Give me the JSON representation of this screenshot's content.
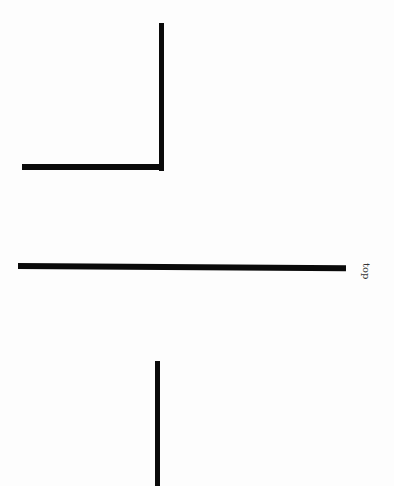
{
  "diagram": {
    "background": "#fdfdfd",
    "stroke_color": "#0a0a0a",
    "elements": [
      {
        "name": "corner-bracket",
        "shape": "L",
        "vertical": {
          "x": 160,
          "y1": 23,
          "y2": 170
        },
        "horizontal": {
          "y": 166,
          "x1": 22,
          "x2": 163
        }
      },
      {
        "name": "middle-line",
        "shape": "line",
        "x1": 18,
        "x2": 346,
        "y": 266
      },
      {
        "name": "bottom-line",
        "shape": "line",
        "x": 157,
        "y1": 361,
        "y2": 486
      }
    ],
    "label": {
      "text": "top",
      "rotation_deg": 90
    }
  }
}
